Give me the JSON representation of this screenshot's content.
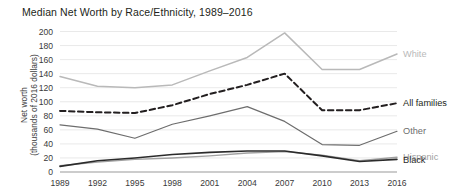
{
  "chart_data": {
    "type": "line",
    "title": "Median Net Worth by Race/Ethnicity, 1989–2016",
    "xlabel": "",
    "ylabel_line1": "Net worth",
    "ylabel_line2": "(thousands of 2016 dollars)",
    "categories": [
      "1989",
      "1992",
      "1995",
      "1998",
      "2001",
      "2004",
      "2007",
      "2010",
      "2013",
      "2016"
    ],
    "x": [
      1989,
      1992,
      1995,
      1998,
      2001,
      2004,
      2007,
      2010,
      2013,
      2016
    ],
    "ylim": [
      0,
      200
    ],
    "yticks": [
      0,
      20,
      40,
      60,
      80,
      100,
      120,
      140,
      160,
      180,
      200
    ],
    "grid": true,
    "legend_position": "right-inline-labels",
    "series": [
      {
        "name": "White",
        "label": "White",
        "color": "#b9b9b9",
        "style": "solid",
        "width": 1.5,
        "values": [
          136,
          122,
          120,
          124,
          144,
          163,
          198,
          146,
          146,
          168
        ]
      },
      {
        "name": "All families",
        "label": "All families",
        "color": "#231f20",
        "style": "dashed",
        "width": 2.0,
        "values": [
          87,
          85,
          84,
          95,
          111,
          124,
          140,
          88,
          88,
          98
        ]
      },
      {
        "name": "Other",
        "label": "Other",
        "color": "#6d6d6d",
        "style": "solid",
        "width": 1.2,
        "values": [
          67,
          61,
          48,
          68,
          80,
          93,
          72,
          39,
          38,
          58
        ]
      },
      {
        "name": "Hispanic",
        "label": "Hispanic",
        "color": "#a0a0a0",
        "style": "solid",
        "width": 1.4,
        "values": [
          9,
          14,
          18,
          20,
          23,
          27,
          29,
          24,
          16,
          21
        ]
      },
      {
        "name": "Black",
        "label": "Black",
        "color": "#2b2b2b",
        "style": "solid",
        "width": 1.6,
        "values": [
          8,
          16,
          20,
          25,
          28,
          30,
          30,
          23,
          15,
          18
        ]
      }
    ]
  }
}
